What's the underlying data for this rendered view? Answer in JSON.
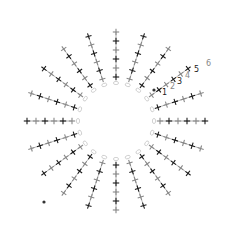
{
  "diagram": {
    "type": "crochet-chart",
    "center": [
      116,
      121
    ],
    "ring_radius": 38,
    "spoke_count": 20,
    "stitch_spacing": 9,
    "stitches_per_spoke": 6,
    "colors": {
      "dark": "#1a1a1a",
      "mid": "#888888",
      "light": "#c8c8c8",
      "background": "#ffffff"
    },
    "row_labels": [
      {
        "text": "1",
        "x": 162,
        "y": 95
      },
      {
        "text": "2",
        "x": 170,
        "y": 89
      },
      {
        "text": "3",
        "x": 177,
        "y": 84
      },
      {
        "text": "4",
        "x": 185,
        "y": 78
      },
      {
        "text": "5",
        "x": 194,
        "y": 72
      },
      {
        "text": "6",
        "x": 206,
        "y": 66
      }
    ],
    "start_dots": [
      {
        "x": 154,
        "y": 90
      },
      {
        "x": 44,
        "y": 202
      }
    ]
  }
}
